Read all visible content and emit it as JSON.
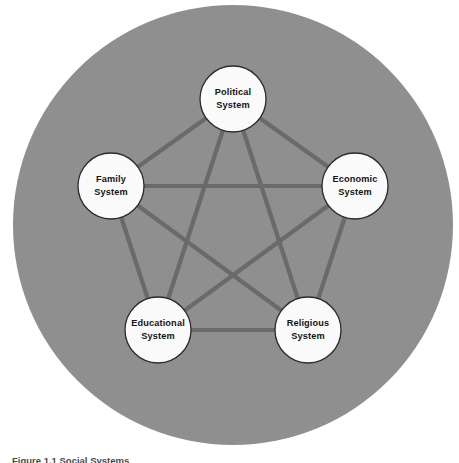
{
  "figure": {
    "caption": "Figure 1.1  Social Systems",
    "background_color": "#ffffff",
    "disc_color": "#8f8f8f",
    "edge_color": "#6a6a6a",
    "node_fill": "#fafafa",
    "node_stroke": "#2b2b2b",
    "label_color": "#151515"
  },
  "disc": {
    "cx": 233,
    "cy": 225,
    "r": 220
  },
  "chart_data": {
    "type": "diagram",
    "layout": "pentagon-complete-graph",
    "title": "Social Systems",
    "center": {
      "x": 233,
      "y": 225
    },
    "node_radius": 33,
    "ring_radius": 128,
    "nodes": [
      {
        "id": "political",
        "line1": "Political",
        "line2": "System",
        "x": 233,
        "y": 99,
        "angle_deg": -90
      },
      {
        "id": "economic",
        "line1": "Economic",
        "line2": "System",
        "x": 355,
        "y": 186,
        "angle_deg": -18
      },
      {
        "id": "religious",
        "line1": "Religious",
        "line2": "System",
        "x": 308,
        "y": 330,
        "angle_deg": 54
      },
      {
        "id": "educational",
        "line1": "Educational",
        "line2": "System",
        "x": 158,
        "y": 330,
        "angle_deg": 126
      },
      {
        "id": "family",
        "line1": "Family",
        "line2": "System",
        "x": 111,
        "y": 186,
        "angle_deg": 198
      }
    ],
    "edges": [
      {
        "from": "political",
        "to": "economic"
      },
      {
        "from": "political",
        "to": "religious"
      },
      {
        "from": "political",
        "to": "educational"
      },
      {
        "from": "political",
        "to": "family"
      },
      {
        "from": "economic",
        "to": "religious"
      },
      {
        "from": "economic",
        "to": "educational"
      },
      {
        "from": "economic",
        "to": "family"
      },
      {
        "from": "religious",
        "to": "educational"
      },
      {
        "from": "religious",
        "to": "family"
      },
      {
        "from": "educational",
        "to": "family"
      }
    ]
  }
}
